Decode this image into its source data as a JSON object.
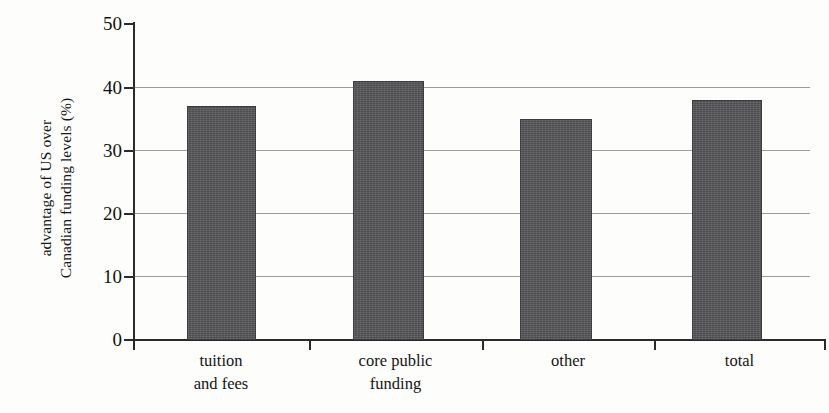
{
  "chart_data": {
    "type": "bar",
    "title": "",
    "xlabel": "",
    "ylabel": "advantage of US over Canadian funding levels (%)",
    "ylabel_lines": [
      "advantage of US over",
      "Canadian funding levels (%)"
    ],
    "categories": [
      "tuition and fees",
      "core public funding",
      "other",
      "total"
    ],
    "category_lines": [
      [
        "tuition",
        "and fees"
      ],
      [
        "core public",
        "funding"
      ],
      [
        "other",
        ""
      ],
      [
        "total",
        ""
      ]
    ],
    "values": [
      37,
      41,
      35,
      38
    ],
    "ylim": [
      0,
      50
    ],
    "ytick_labels": [
      "0",
      "10",
      "20",
      "30",
      "40",
      "50"
    ],
    "ytick_values": [
      0,
      10,
      20,
      30,
      40,
      50
    ],
    "grid": "horizontal",
    "legend": "none",
    "bar_color": "#56565a",
    "axis_color": "#2a2a2a",
    "grid_color": "#4a4a4a",
    "background_color": "#fdfdfb"
  }
}
